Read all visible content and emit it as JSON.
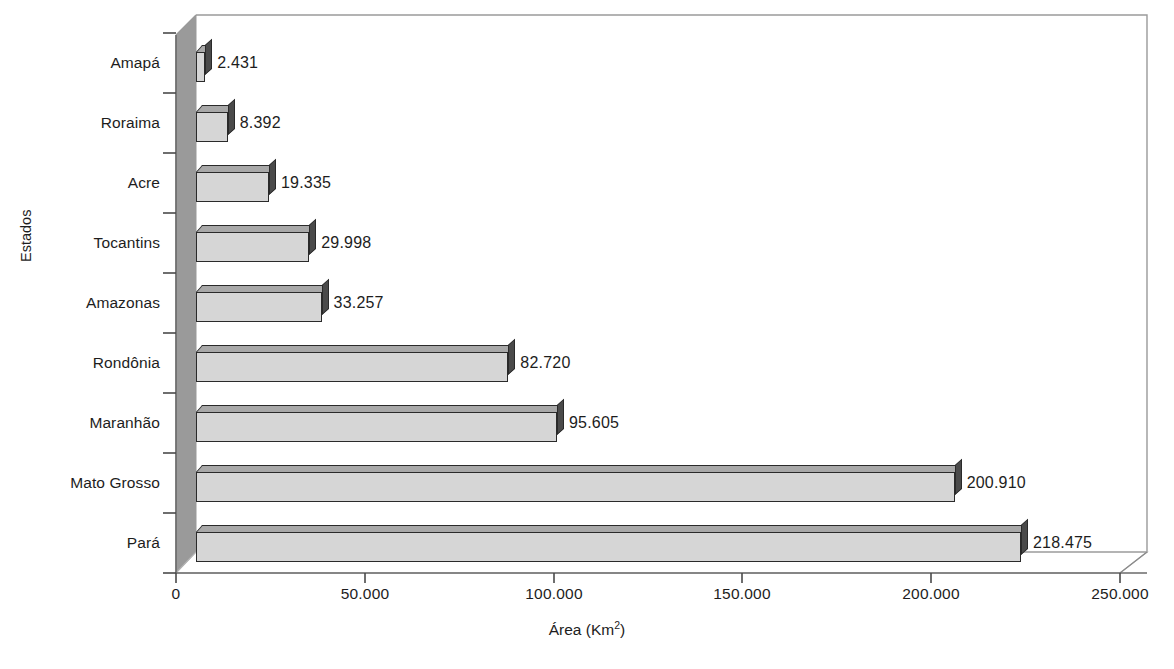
{
  "chart_data": {
    "type": "bar",
    "orientation": "horizontal",
    "style": "3d-bars-grayscale",
    "title": "",
    "xlabel": "Área (Km²)",
    "ylabel": "Estados",
    "xlim": [
      0,
      250000
    ],
    "xticks": [
      0,
      50000,
      100000,
      150000,
      200000,
      250000
    ],
    "xtick_labels": [
      "0",
      "50.000",
      "100.000",
      "150.000",
      "200.000",
      "250.000"
    ],
    "grid": false,
    "legend": null,
    "categories": [
      "Amapá",
      "Roraima",
      "Acre",
      "Tocantins",
      "Amazonas",
      "Rondônia",
      "Maranhão",
      "Mato Grosso",
      "Pará"
    ],
    "values": [
      2431,
      8392,
      19335,
      29998,
      33257,
      82720,
      95605,
      200910,
      218475
    ],
    "value_labels": [
      "2.431",
      "8.392",
      "19.335",
      "29.998",
      "33.257",
      "82.720",
      "95.605",
      "200.910",
      "218.475"
    ]
  },
  "colors": {
    "bar_face": "#d6d6d6",
    "bar_top": "#a8a8a8",
    "bar_side": "#4a4a4a",
    "bar_outline": "#2a2a2a",
    "wall_side": "#9a9a9a",
    "frame_line": "#8a8a8a",
    "axis_line": "#5a5a5a",
    "text": "#1d1d1d"
  },
  "axis_title_x_parts": {
    "main": "Área (Km",
    "superscript": "2",
    "tail": ")"
  }
}
